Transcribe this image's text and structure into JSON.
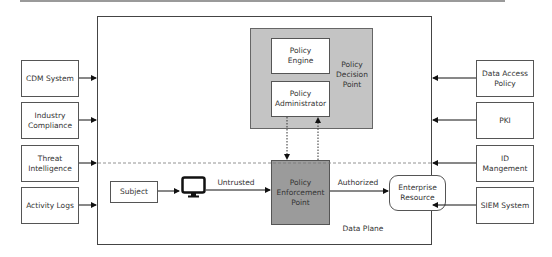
{
  "diagram": {
    "left_inputs": [
      {
        "label": "CDM System"
      },
      {
        "label": "Industry Compliance"
      },
      {
        "label": "Threat Intelligence"
      },
      {
        "label": "Activity Logs"
      }
    ],
    "right_inputs": [
      {
        "label": "Data Access Policy"
      },
      {
        "label": "PKI"
      },
      {
        "label": "ID Mangement"
      },
      {
        "label": "SIEM System"
      }
    ],
    "control_plane": {
      "pdp_label": "Policy Decision Point",
      "policy_engine": "Policy Engine",
      "policy_administrator": "Policy Administrator"
    },
    "data_plane": {
      "label": "Data Plane",
      "subject": "Subject",
      "device_icon": "monitor-icon",
      "untrusted_label": "Untrusted",
      "pep": "Policy Enforcement Point",
      "authorized_label": "Authorized",
      "resource": "Enterprise Resource"
    },
    "colors": {
      "pdp_fill": "#c4c4c4",
      "pep_fill": "#9b9b9b",
      "stroke": "#444444"
    }
  }
}
